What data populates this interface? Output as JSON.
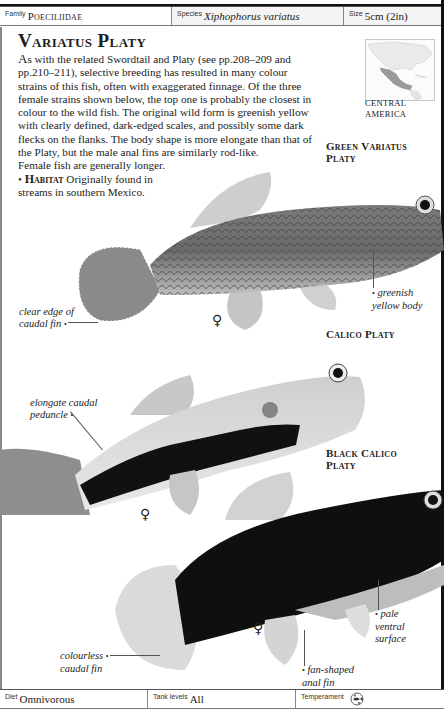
{
  "header": {
    "family_label": "Family",
    "family_value": "Poeciliidae",
    "species_label": "Species",
    "species_value": "Xiphophorus variatus",
    "size_label": "Size",
    "size_value": "5cm (2in)"
  },
  "article": {
    "title": "Variatus Platy",
    "dropcap": "A",
    "body": "s with the related Swordtail and Platy (see pp.208–209 and pp.210–211), selective breeding has resulted in many colour strains of this fish, often with exaggerated finnage. Of the three female strains shown below, the top one is probably the closest in colour to the wild fish. The original wild form is greenish yellow with clearly defined, dark-edged scales, and possibly some dark flecks on the flanks. The body shape is more elongate than that of the Platy, but the male anal fins are similarly rod-like.",
    "body_2": "Female fish are generally longer.",
    "habitat_bullet": "•",
    "habitat_label": "Habitat",
    "habitat_text": "Originally found in streams in southern Mexico."
  },
  "map": {
    "caption_line1": "CENTRAL",
    "caption_line2": "AMERICA"
  },
  "strains": [
    {
      "label_line1": "Green Variatus",
      "label_line2": "Platy"
    },
    {
      "label_line1": "Calico Platy",
      "label_line2": ""
    },
    {
      "label_line1": "Black Calico",
      "label_line2": "Platy"
    }
  ],
  "callouts": {
    "clear_edge_1": "clear edge of",
    "clear_edge_2": "caudal fin",
    "greenish_1": "greenish",
    "greenish_2": "yellow body",
    "elongate_1": "elongate caudal",
    "elongate_2": "peduncle",
    "pale_1": "pale",
    "pale_2": "ventral",
    "pale_3": "surface",
    "colourless_1": "colourless",
    "colourless_2": "caudal fin",
    "fan_1": "fan-shaped",
    "fan_2": "anal fin",
    "bullet": "•",
    "female_symbol": "♀"
  },
  "footer": {
    "diet_label": "Diet",
    "diet_value": "Omnivorous",
    "tank_label": "Tank levels",
    "tank_value": "All",
    "temperament_label": "Temperament",
    "temperament_icon": "peaceful-fish-icon"
  }
}
